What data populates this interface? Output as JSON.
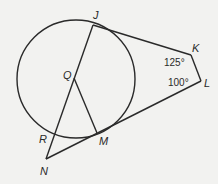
{
  "diagram": {
    "type": "geometry",
    "circle": {
      "center_label": "Q",
      "cx": 76,
      "cy": 79,
      "r": 59
    },
    "points": {
      "J": {
        "label": "J",
        "x": 93,
        "y": 25
      },
      "K": {
        "label": "K",
        "x": 191,
        "y": 55
      },
      "L": {
        "label": "L",
        "x": 201,
        "y": 81
      },
      "M": {
        "label": "M",
        "x": 97,
        "y": 133
      },
      "R": {
        "label": "R",
        "x": 55,
        "y": 132
      },
      "N": {
        "label": "N",
        "x": 46,
        "y": 159
      },
      "Q": {
        "label": "Q",
        "x": 74,
        "y": 78
      }
    },
    "angles": {
      "K": "125°",
      "L": "100°"
    },
    "segments": [
      "JK",
      "KL",
      "LN",
      "JN",
      "QM"
    ]
  }
}
